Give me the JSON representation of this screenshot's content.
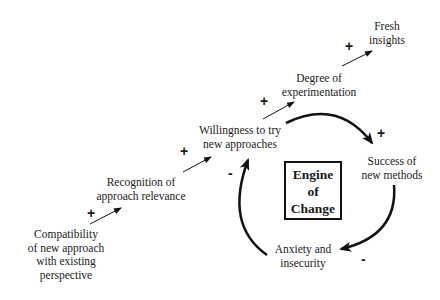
{
  "diagram": {
    "title": "Engine of Change",
    "center_label": [
      "Engine",
      "of",
      "Change"
    ],
    "nodes": [
      {
        "id": "compatibility",
        "lines": [
          "Compatibility",
          "of new approach",
          "with existing",
          "perspective"
        ]
      },
      {
        "id": "recognition",
        "lines": [
          "Recognition of",
          "approach relevance"
        ]
      },
      {
        "id": "willingness",
        "lines": [
          "Willingness to try",
          "new approaches"
        ]
      },
      {
        "id": "experimentation",
        "lines": [
          "Degree of",
          "experimentation"
        ]
      },
      {
        "id": "fresh_insights",
        "lines": [
          "Fresh",
          "insights"
        ]
      },
      {
        "id": "success",
        "lines": [
          "Success of",
          "new methods"
        ]
      },
      {
        "id": "anxiety",
        "lines": [
          "Anxiety and",
          "insecurity"
        ]
      }
    ],
    "links": [
      {
        "from": "compatibility",
        "to": "recognition",
        "polarity": "+"
      },
      {
        "from": "recognition",
        "to": "willingness",
        "polarity": "+"
      },
      {
        "from": "willingness",
        "to": "experimentation",
        "polarity": "+"
      },
      {
        "from": "experimentation",
        "to": "fresh_insights",
        "polarity": "+"
      },
      {
        "from": "willingness",
        "to": "success",
        "polarity": "+"
      },
      {
        "from": "success",
        "to": "anxiety",
        "polarity": "-"
      },
      {
        "from": "anxiety",
        "to": "willingness",
        "polarity": "-"
      }
    ]
  }
}
